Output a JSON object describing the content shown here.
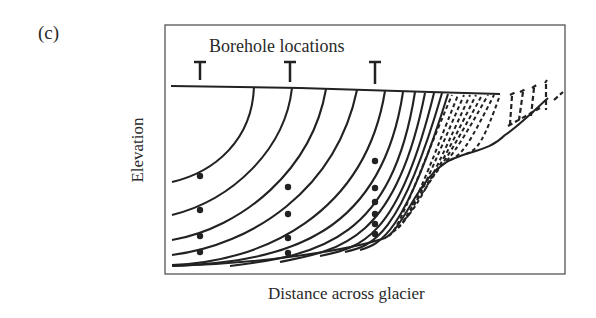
{
  "figure": {
    "panel_label": "(c)",
    "title": "Borehole locations",
    "xlabel": "Distance across glacier",
    "ylabel": "Elevation"
  },
  "diagram": {
    "type": "glacier cross-section with internal flow/velocity contours",
    "boreholes": [
      {
        "id": 1,
        "x": 200,
        "markers_y": [
          176,
          210,
          236,
          252
        ]
      },
      {
        "id": 2,
        "x": 288,
        "markers_y": [
          187,
          214,
          238,
          253
        ]
      },
      {
        "id": 3,
        "x": 375,
        "markers_y": [
          161,
          188,
          202,
          214,
          224,
          234
        ]
      }
    ],
    "contour_style": {
      "solid_region": "glacier interior",
      "dashed_region": "glacier margin"
    },
    "colors": {
      "line": "#222222",
      "frame": "#555555",
      "background": "#ffffff"
    }
  }
}
